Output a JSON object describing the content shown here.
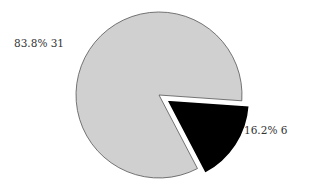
{
  "chart_data": {
    "type": "pie",
    "title": "",
    "categories": [
      "Slice A",
      "Slice B"
    ],
    "values": [
      31,
      6
    ],
    "percentages": [
      83.8,
      16.2
    ],
    "labels": [
      "83.8%  31",
      "16.2%  6"
    ],
    "colors": [
      "#d0d0d0",
      "#000000"
    ],
    "exploded": [
      false,
      true
    ],
    "legend": "none",
    "outline_color": "#555555"
  },
  "labels": {
    "slice_a": "83.8%  31",
    "slice_b": "16.2%  6"
  }
}
